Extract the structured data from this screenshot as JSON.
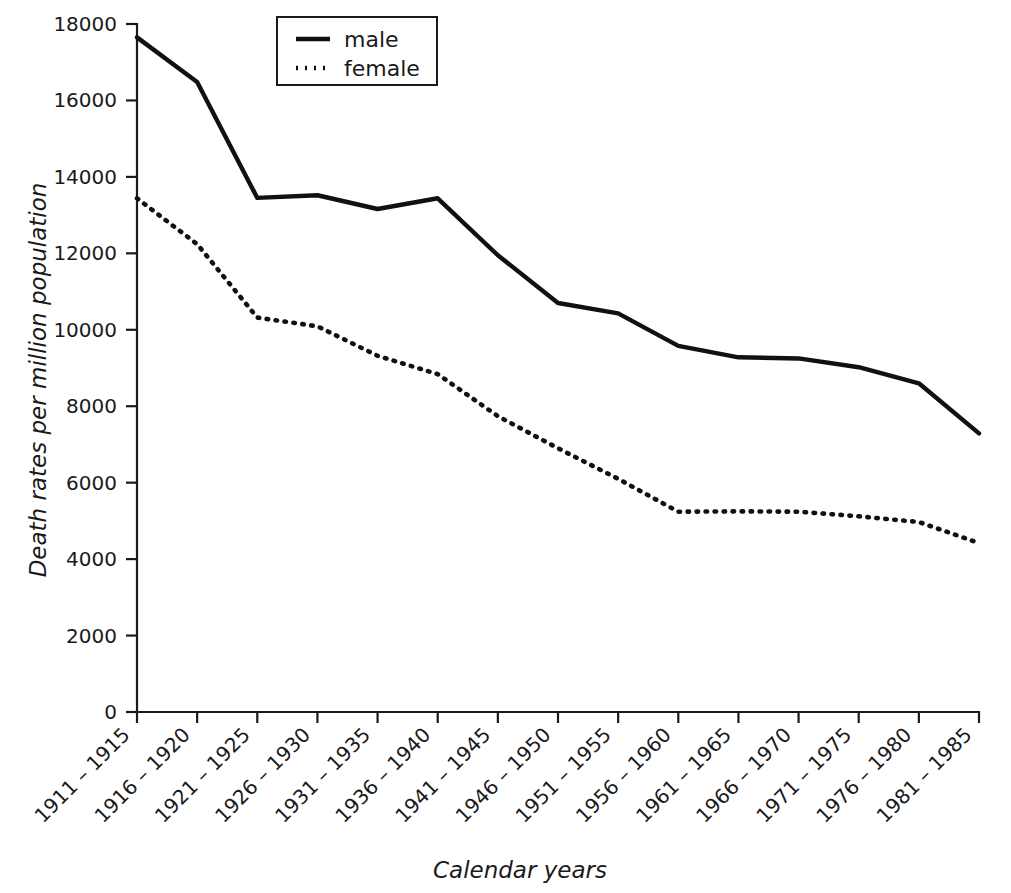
{
  "chart_data": {
    "type": "line",
    "title": "",
    "xlabel": "Calendar years",
    "ylabel": "Death rates per million population",
    "categories": [
      "1911 – 1915",
      "1916 – 1920",
      "1921 – 1925",
      "1926 – 1930",
      "1931 – 1935",
      "1936 – 1940",
      "1941 – 1945",
      "1946 – 1950",
      "1951 – 1955",
      "1956 – 1960",
      "1961 – 1965",
      "1966 – 1970",
      "1971 – 1975",
      "1976 – 1980",
      "1981 – 1985"
    ],
    "series": [
      {
        "name": "male",
        "style": "solid",
        "color": "#111111",
        "values": [
          17650,
          16480,
          13450,
          13520,
          13160,
          13440,
          11950,
          10700,
          10430,
          9580,
          9280,
          9250,
          9020,
          8600,
          7290
        ]
      },
      {
        "name": "female",
        "style": "dotted",
        "color": "#111111",
        "values": [
          13440,
          12240,
          10320,
          10090,
          9320,
          8840,
          7740,
          6900,
          6100,
          5240,
          5250,
          5240,
          5120,
          4970,
          4420
        ]
      }
    ],
    "ylim": [
      0,
      18000
    ],
    "ytick_values": [
      0,
      2000,
      4000,
      6000,
      8000,
      10000,
      12000,
      14000,
      16000,
      18000
    ],
    "ytick_labels": [
      "0",
      "2000",
      "4000",
      "6000",
      "8000",
      "10000",
      "12000",
      "14000",
      "16000",
      "18000"
    ],
    "grid": false,
    "legend": {
      "position": "top-center",
      "entries": [
        {
          "label": "male",
          "style": "solid"
        },
        {
          "label": "female",
          "style": "dotted"
        }
      ]
    },
    "xtick_rotation": 45
  }
}
